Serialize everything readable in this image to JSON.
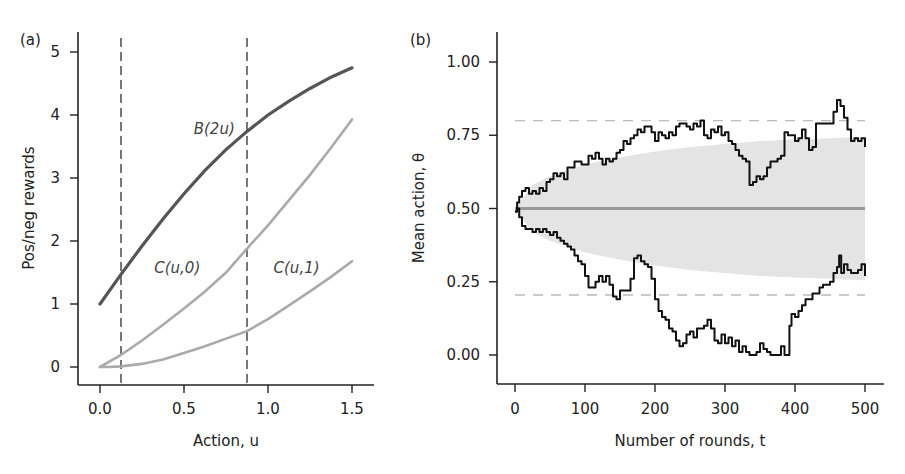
{
  "chart_data": [
    {
      "panel": "(a)",
      "type": "line",
      "title": "",
      "xlabel": "Action, u",
      "ylabel": "Pos/neg rewards",
      "xlim": [
        -0.125,
        1.62
      ],
      "ylim": [
        -0.3,
        5.3
      ],
      "xticks": [
        0.0,
        0.5,
        1.0,
        1.5
      ],
      "xtick_labels": [
        "0.0",
        "0.5",
        "1.0",
        "1.5"
      ],
      "yticks": [
        0,
        1,
        2,
        3,
        4,
        5
      ],
      "ytick_labels": [
        "0",
        "1",
        "2",
        "3",
        "4",
        "5"
      ],
      "grid": false,
      "vlines": [
        {
          "x": 0.125,
          "style": "dashed",
          "color": "#555555"
        },
        {
          "x": 0.875,
          "style": "dashed",
          "color": "#555555"
        }
      ],
      "series": [
        {
          "name": "B(2u)",
          "color": "#555555",
          "width": 3.2,
          "x": [
            0.0,
            0.125,
            0.25,
            0.375,
            0.5,
            0.625,
            0.75,
            0.875,
            1.0,
            1.125,
            1.25,
            1.375,
            1.5
          ],
          "y": [
            1.0,
            1.47,
            1.92,
            2.35,
            2.75,
            3.12,
            3.45,
            3.74,
            4.0,
            4.22,
            4.42,
            4.6,
            4.75
          ],
          "label_pos": [
            0.68,
            3.7
          ]
        },
        {
          "name": "C(u,0)",
          "color": "#aaaaaa",
          "width": 2.6,
          "x": [
            0.0,
            0.125,
            0.25,
            0.375,
            0.5,
            0.625,
            0.75,
            0.875,
            1.0,
            1.125,
            1.25,
            1.375,
            1.5
          ],
          "y": [
            0.0,
            0.19,
            0.42,
            0.67,
            0.93,
            1.2,
            1.5,
            1.88,
            2.25,
            2.65,
            3.05,
            3.48,
            3.93
          ],
          "label_pos": [
            0.46,
            1.5
          ]
        },
        {
          "name": "C(u,1)",
          "color": "#aaaaaa",
          "width": 2.6,
          "x": [
            0.0,
            0.05,
            0.125,
            0.25,
            0.375,
            0.5,
            0.625,
            0.75,
            0.875,
            1.0,
            1.125,
            1.25,
            1.375,
            1.5
          ],
          "y": [
            0.0,
            0.0,
            0.01,
            0.05,
            0.12,
            0.22,
            0.33,
            0.45,
            0.57,
            0.76,
            0.98,
            1.2,
            1.43,
            1.68
          ],
          "label_pos": [
            1.17,
            1.5
          ]
        }
      ]
    },
    {
      "panel": "(b)",
      "type": "line",
      "title": "",
      "xlabel": "Number of rounds, t",
      "ylabel": "Mean action, θ",
      "xlim": [
        -25,
        525
      ],
      "ylim": [
        -0.12,
        1.1
      ],
      "xticks": [
        0,
        100,
        200,
        300,
        400,
        500
      ],
      "xtick_labels": [
        "0",
        "100",
        "200",
        "300",
        "400",
        "500"
      ],
      "yticks": [
        0.0,
        0.25,
        0.5,
        0.75,
        1.0
      ],
      "ytick_labels": [
        "0.00",
        "0.25",
        "0.50",
        "0.75",
        "1.00"
      ],
      "grid": false,
      "hlines": [
        {
          "y": 0.8,
          "style": "dashed",
          "color": "#bbbbbb"
        },
        {
          "y": 0.205,
          "style": "dashed",
          "color": "#bbbbbb"
        }
      ],
      "band": {
        "color": "#e4e4e4",
        "x": [
          0,
          25,
          50,
          100,
          150,
          200,
          250,
          300,
          350,
          400,
          450,
          500
        ],
        "upper": [
          0.5,
          0.58,
          0.61,
          0.65,
          0.675,
          0.695,
          0.71,
          0.72,
          0.73,
          0.735,
          0.74,
          0.745
        ],
        "lower": [
          0.5,
          0.42,
          0.39,
          0.35,
          0.325,
          0.305,
          0.29,
          0.28,
          0.27,
          0.265,
          0.26,
          0.255
        ]
      },
      "series": [
        {
          "name": "Mean",
          "color": "#999999",
          "width": 3,
          "x": [
            0,
            500
          ],
          "y": [
            0.5,
            0.5
          ]
        },
        {
          "name": "Upper walk",
          "color": "#111111",
          "width": 2,
          "x": [
            0,
            3,
            6,
            10,
            15,
            20,
            25,
            30,
            35,
            40,
            45,
            50,
            55,
            60,
            65,
            70,
            75,
            80,
            85,
            90,
            95,
            100,
            105,
            110,
            115,
            120,
            125,
            130,
            135,
            140,
            145,
            150,
            155,
            160,
            165,
            170,
            175,
            180,
            185,
            190,
            195,
            200,
            205,
            210,
            215,
            220,
            225,
            230,
            235,
            240,
            245,
            250,
            255,
            260,
            265,
            270,
            275,
            280,
            285,
            290,
            295,
            300,
            305,
            310,
            315,
            320,
            325,
            330,
            335,
            340,
            345,
            350,
            355,
            360,
            365,
            370,
            375,
            380,
            385,
            390,
            395,
            400,
            405,
            410,
            415,
            420,
            425,
            430,
            435,
            440,
            445,
            450,
            455,
            460,
            465,
            470,
            475,
            480,
            485,
            490,
            495,
            500
          ],
          "y": [
            0.49,
            0.52,
            0.54,
            0.56,
            0.57,
            0.55,
            0.56,
            0.55,
            0.57,
            0.56,
            0.59,
            0.6,
            0.62,
            0.61,
            0.62,
            0.6,
            0.64,
            0.64,
            0.66,
            0.66,
            0.65,
            0.65,
            0.68,
            0.67,
            0.69,
            0.67,
            0.65,
            0.67,
            0.66,
            0.67,
            0.69,
            0.7,
            0.73,
            0.72,
            0.74,
            0.75,
            0.77,
            0.76,
            0.78,
            0.78,
            0.76,
            0.73,
            0.76,
            0.75,
            0.74,
            0.76,
            0.75,
            0.78,
            0.79,
            0.79,
            0.78,
            0.77,
            0.79,
            0.78,
            0.8,
            0.75,
            0.74,
            0.77,
            0.76,
            0.78,
            0.75,
            0.76,
            0.73,
            0.72,
            0.7,
            0.68,
            0.67,
            0.66,
            0.58,
            0.59,
            0.61,
            0.6,
            0.61,
            0.64,
            0.66,
            0.66,
            0.67,
            0.68,
            0.76,
            0.75,
            0.75,
            0.73,
            0.74,
            0.77,
            0.74,
            0.7,
            0.71,
            0.72,
            0.67,
            0.65,
            0.63,
            0.63,
            0.65,
            0.66,
            0.68,
            0.67,
            0.69,
            0.7,
            0.72,
            0.73,
            0.79,
            0.79
          ],
          "x2": [
            430,
            440,
            450,
            455,
            460,
            465,
            470,
            475,
            480,
            485,
            490,
            495,
            500
          ],
          "y2": [
            0.79,
            0.79,
            0.79,
            0.83,
            0.87,
            0.85,
            0.81,
            0.77,
            0.73,
            0.74,
            0.73,
            0.74,
            0.71
          ]
        },
        {
          "name": "Lower walk",
          "color": "#111111",
          "width": 2,
          "x": [
            0,
            3,
            6,
            10,
            15,
            20,
            25,
            30,
            35,
            40,
            45,
            50,
            55,
            60,
            65,
            70,
            75,
            80,
            85,
            90,
            95,
            100,
            105,
            110,
            115,
            120,
            125,
            130,
            135,
            140,
            145,
            150,
            155,
            160,
            165,
            170,
            175,
            180,
            185,
            190,
            195,
            200,
            205,
            210,
            215,
            220,
            225,
            230,
            235,
            240,
            245,
            250,
            255,
            260,
            265,
            270,
            275,
            280,
            285,
            290,
            295,
            300,
            305,
            310,
            315,
            320,
            325,
            330,
            335,
            340,
            345,
            350,
            355,
            360,
            365,
            370,
            375,
            380,
            385,
            388,
            392,
            395,
            400,
            405,
            410,
            415,
            420,
            425,
            430,
            435,
            440,
            445,
            450,
            455,
            460,
            465,
            470,
            475,
            480,
            485,
            490,
            495,
            500
          ],
          "y": [
            0.49,
            0.5,
            0.47,
            0.44,
            0.43,
            0.43,
            0.42,
            0.43,
            0.42,
            0.43,
            0.42,
            0.41,
            0.42,
            0.4,
            0.39,
            0.38,
            0.37,
            0.36,
            0.34,
            0.32,
            0.31,
            0.27,
            0.23,
            0.23,
            0.25,
            0.27,
            0.25,
            0.27,
            0.24,
            0.2,
            0.19,
            0.22,
            0.22,
            0.22,
            0.26,
            0.33,
            0.34,
            0.32,
            0.31,
            0.3,
            0.26,
            0.19,
            0.15,
            0.13,
            0.12,
            0.09,
            0.08,
            0.05,
            0.03,
            0.04,
            0.07,
            0.08,
            0.06,
            0.09,
            0.09,
            0.1,
            0.12,
            0.09,
            0.05,
            0.04,
            0.07,
            0.04,
            0.06,
            0.03,
            0.05,
            0.01,
            0.03,
            0.01,
            0.0,
            0.0,
            0.01,
            0.04,
            0.02,
            0.01,
            0.0,
            0.0,
            0.0,
            0.03,
            0.0,
            0.0,
            0.1,
            0.14,
            0.13,
            0.15,
            0.17,
            0.19,
            0.19,
            0.21,
            0.21,
            0.23,
            0.24,
            0.25,
            0.24,
            0.22,
            0.25,
            0.25,
            0.26,
            0.28,
            0.27,
            0.3,
            0.25,
            0.31,
            0.29
          ]
        },
        {
          "name": "Lower walk end",
          "color": "#111111",
          "width": 2,
          "x": [
            440,
            450,
            455,
            460,
            463,
            466,
            470,
            475,
            480,
            485,
            490,
            495,
            500
          ],
          "y": [
            0.24,
            0.25,
            0.28,
            0.3,
            0.34,
            0.28,
            0.31,
            0.29,
            0.28,
            0.28,
            0.29,
            0.31,
            0.27
          ]
        }
      ]
    }
  ]
}
